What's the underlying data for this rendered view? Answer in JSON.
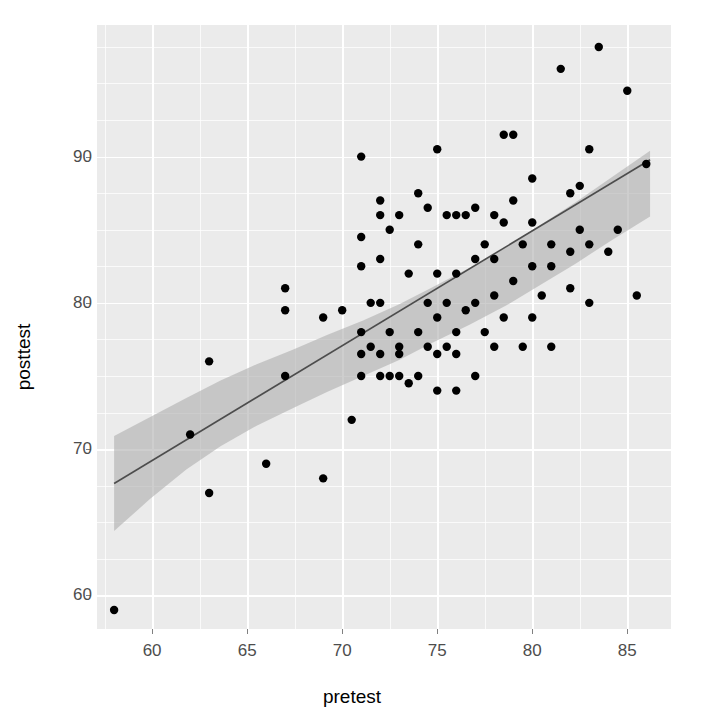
{
  "chart_data": {
    "type": "scatter",
    "title": "",
    "xlabel": "pretest",
    "ylabel": "posttest",
    "xlim": [
      57.1,
      87.3
    ],
    "ylim": [
      57.7,
      99.0
    ],
    "xticks": [
      60,
      65,
      70,
      75,
      80,
      85
    ],
    "yticks": [
      60,
      70,
      80,
      90
    ],
    "xtick_labels": [
      "60",
      "65",
      "70",
      "75",
      "80",
      "85"
    ],
    "ytick_labels": [
      "60",
      "70",
      "80",
      "90"
    ],
    "x_minor_step": 2.5,
    "y_minor_step": 2.5,
    "grid": true,
    "legend": "none",
    "panel_background": "#ebebeb",
    "grid_color": "#ffffff",
    "point_color": "#000000",
    "point_size": 4.2,
    "regression": {
      "type": "linear-fit",
      "line_color": "#4d4d4d",
      "band_color": "#b0b0b0",
      "band_opacity": 0.62,
      "slope": 0.785,
      "intercept": 22.1,
      "x_start": 58.0,
      "x_end": 86.2,
      "y_start": 67.65,
      "y_end": 89.79,
      "ci_lower": [
        64.4,
        66.6,
        68.6,
        70.2,
        71.6,
        72.8,
        73.9,
        75.0,
        76.1,
        77.3,
        78.5,
        79.8,
        81.2,
        82.7,
        84.3,
        85.9
      ],
      "ci_upper": [
        70.9,
        72.2,
        73.5,
        74.7,
        75.8,
        76.8,
        77.8,
        78.8,
        79.9,
        81.1,
        82.4,
        83.8,
        85.3,
        86.9,
        88.6,
        90.4
      ],
      "ci_x": [
        58.0,
        59.9,
        61.8,
        63.6,
        65.5,
        67.4,
        69.2,
        71.1,
        73.0,
        74.8,
        76.7,
        78.6,
        80.4,
        82.3,
        84.2,
        86.2
      ]
    },
    "x": [
      58.0,
      62.0,
      63.0,
      63.0,
      66.0,
      67.0,
      67.0,
      67.0,
      69.0,
      69.0,
      70.0,
      70.5,
      71.0,
      71.0,
      71.0,
      71.0,
      71.0,
      71.0,
      71.5,
      71.5,
      72.0,
      72.0,
      72.0,
      72.0,
      72.0,
      72.0,
      72.5,
      72.5,
      72.5,
      73.0,
      73.0,
      73.0,
      73.0,
      73.5,
      73.5,
      74.0,
      74.0,
      74.0,
      74.0,
      74.5,
      74.5,
      74.5,
      75.0,
      75.0,
      75.0,
      75.0,
      75.0,
      75.5,
      75.5,
      75.5,
      76.0,
      76.0,
      76.0,
      76.0,
      76.0,
      76.5,
      76.5,
      77.0,
      77.0,
      77.0,
      77.0,
      77.5,
      77.5,
      78.0,
      78.0,
      78.0,
      78.0,
      78.5,
      78.5,
      78.5,
      79.0,
      79.0,
      79.0,
      79.5,
      79.5,
      80.0,
      80.0,
      80.0,
      80.0,
      80.5,
      81.0,
      81.0,
      81.0,
      81.5,
      82.0,
      82.0,
      82.0,
      82.5,
      82.5,
      83.0,
      83.0,
      83.0,
      83.5,
      84.0,
      84.5,
      85.0,
      85.5,
      86.0
    ],
    "y": [
      59.0,
      71.0,
      67.0,
      76.0,
      69.0,
      75.0,
      79.5,
      81.0,
      68.0,
      79.0,
      79.5,
      72.0,
      75.0,
      76.5,
      78.0,
      82.5,
      84.5,
      90.0,
      77.0,
      80.0,
      75.0,
      76.5,
      80.0,
      83.0,
      86.0,
      87.0,
      75.0,
      78.0,
      85.0,
      75.0,
      76.5,
      77.0,
      86.0,
      74.5,
      82.0,
      75.0,
      78.0,
      84.0,
      87.5,
      77.0,
      80.0,
      86.5,
      74.0,
      76.5,
      79.0,
      82.0,
      90.5,
      77.0,
      80.0,
      86.0,
      74.0,
      76.5,
      78.0,
      82.0,
      86.0,
      79.5,
      86.0,
      75.0,
      80.0,
      83.0,
      86.5,
      78.0,
      84.0,
      77.0,
      80.5,
      83.0,
      86.0,
      79.0,
      85.5,
      91.5,
      81.5,
      87.0,
      91.5,
      77.0,
      84.0,
      79.0,
      82.5,
      85.5,
      88.5,
      80.5,
      77.0,
      82.5,
      84.0,
      96.0,
      81.0,
      83.5,
      87.5,
      85.0,
      88.0,
      80.0,
      84.0,
      90.5,
      97.5,
      83.5,
      85.0,
      94.5,
      80.5,
      89.5
    ]
  },
  "axis": {
    "x_title": "pretest",
    "y_title": "posttest"
  }
}
